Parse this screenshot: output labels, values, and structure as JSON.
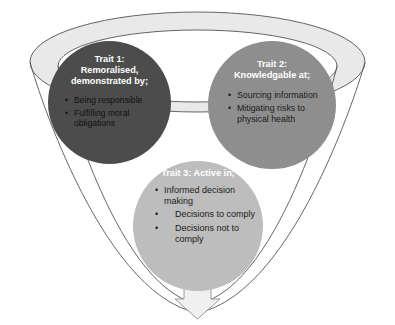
{
  "diagram": {
    "type": "funnel-with-three-bubbles",
    "background_color": "#ffffff",
    "funnel": {
      "name": "funnel-shape",
      "fill_color": "#ffffff",
      "rim_band_color": "#e9e9e9",
      "outline_color": "#555555"
    },
    "arrow": {
      "name": "down-arrow",
      "fill_color": "#f0f0f0",
      "outline_color": "#9a9a9a"
    },
    "bubbles": [
      {
        "id": "trait1",
        "color": "#4c4c4c",
        "title": "Trait 1:\nRemoralised,\ndemonstrated by;",
        "items": [
          "Being responsible",
          "Fulfilling moral obligations"
        ]
      },
      {
        "id": "trait2",
        "color": "#8e8e8e",
        "title": "Trait 2:\nKnowledgable at;",
        "items": [
          "Sourcing information",
          "Mitigating risks to physical health"
        ]
      },
      {
        "id": "trait3",
        "color": "#bdbdbd",
        "title": "Trait 3: Active in;",
        "items": [
          "Informed decision making",
          "Decisions to comply",
          "Decisions not to comply"
        ]
      }
    ],
    "bullet_glyph": "•"
  }
}
